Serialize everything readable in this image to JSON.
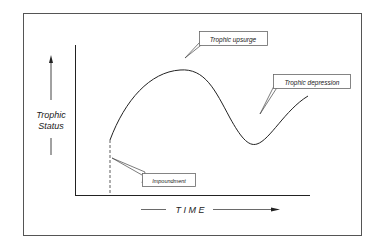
{
  "diagram": {
    "y_axis_label_line1": "Trophic",
    "y_axis_label_line2": "Status",
    "x_axis_label": "T I M E",
    "callouts": {
      "upsurge": "Trophic upsurge",
      "depression": "Trophic depression",
      "impoundment": "Impoundment"
    },
    "colors": {
      "line": "#222222",
      "frame": "#555555",
      "background": "#ffffff"
    }
  }
}
